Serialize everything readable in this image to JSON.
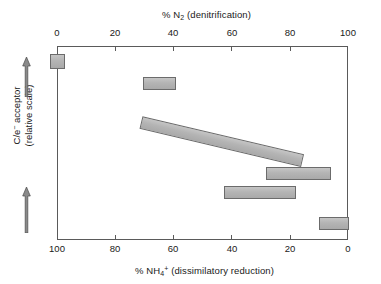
{
  "figure": {
    "background_color": "#ffffff",
    "frame_color": "#5a5a5a",
    "bar_fill_color": "#b4b4b4",
    "bar_border_color": "#6b6b6b"
  },
  "axes": {
    "top": {
      "title_prefix": "% N",
      "title_sub": "2",
      "title_suffix": " (denitrification)",
      "ticks": [
        "0",
        "20",
        "40",
        "60",
        "80",
        "100"
      ],
      "range": [
        0,
        100
      ]
    },
    "bottom": {
      "title_prefix": "% NH",
      "title_sub": "4",
      "title_sup": "+",
      "title_suffix": " (dissimilatory reduction)",
      "ticks": [
        "100",
        "80",
        "60",
        "40",
        "20",
        "0"
      ],
      "range": [
        100,
        0
      ]
    },
    "left": {
      "title_line1_prefix": "C/e",
      "title_line1_sup": "−",
      "title_line1_suffix": " acceptor",
      "title_line2": "(relative scale)",
      "arrow_top": "up-arrow",
      "arrow_bottom": "up-arrow"
    }
  },
  "chart_data": {
    "type": "bar",
    "title": "",
    "subtitle": "",
    "xlabel": "% N2 (denitrification)",
    "xlabel_secondary": "% NH4+ (dissimilatory reduction)",
    "ylabel": "C/e- acceptor (relative scale)",
    "orientation": "horizontal-range-bars",
    "xlim": [
      0,
      100
    ],
    "xlim_secondary": [
      100,
      0
    ],
    "grid": false,
    "legend": null,
    "note": "Each bar spans a range of % N2 produced by denitrification; the complementary value on the reversed lower axis is % NH4+ from dissimilatory reduction. Bars are ordered top to bottom by decreasing C/electron-acceptor ratio.",
    "bars": [
      {
        "id": "marker-0",
        "shape": "square",
        "n2_start": 0,
        "n2_end": 0,
        "nh4_start": 100,
        "nh4_end": 100,
        "row": 1
      },
      {
        "id": "bar-1",
        "shape": "rect",
        "n2_start": 30,
        "n2_end": 41,
        "nh4_start": 70,
        "nh4_end": 59,
        "row": 2
      },
      {
        "id": "bar-2-diagonal",
        "shape": "diagonal",
        "n2_start": 29,
        "n2_end": 79,
        "nh4_start": 71,
        "nh4_end": 21,
        "row": 3
      },
      {
        "id": "bar-3",
        "shape": "rect",
        "n2_start": 70,
        "n2_end": 92,
        "nh4_start": 30,
        "nh4_end": 8,
        "row": 4
      },
      {
        "id": "bar-4",
        "shape": "rect",
        "n2_start": 57,
        "n2_end": 81,
        "nh4_start": 43,
        "nh4_end": 19,
        "row": 5
      },
      {
        "id": "bar-5",
        "shape": "rect",
        "n2_start": 91,
        "n2_end": 100,
        "nh4_start": 9,
        "nh4_end": 0,
        "row": 6
      }
    ]
  },
  "geometry": {
    "plot_left": 57,
    "plot_top": 46,
    "plot_width": 291,
    "plot_height": 194,
    "bar_pixels": [
      {
        "left": 50,
        "top": 54,
        "width": 15,
        "height": 15
      },
      {
        "left": 143,
        "top": 77,
        "width": 33,
        "height": 13
      },
      {
        "left": 266,
        "top": 167,
        "width": 65,
        "height": 13
      },
      {
        "left": 224,
        "top": 186,
        "width": 72,
        "height": 13
      },
      {
        "left": 319,
        "top": 217,
        "width": 30,
        "height": 13
      }
    ],
    "tick_x": [
      57,
      115.2,
      173.4,
      231.6,
      289.8,
      348
    ]
  }
}
